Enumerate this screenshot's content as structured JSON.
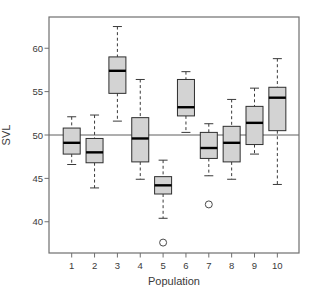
{
  "chart_data": {
    "type": "boxplot",
    "title": "",
    "xlabel": "Population",
    "ylabel": "SVL",
    "categories": [
      "1",
      "2",
      "3",
      "4",
      "5",
      "6",
      "7",
      "8",
      "9",
      "10"
    ],
    "yticks": [
      40,
      45,
      50,
      55,
      60
    ],
    "ylim": [
      36.4,
      63.6
    ],
    "reference_line": 50,
    "legend": "none",
    "grid": false,
    "boxes": [
      {
        "pop": "1",
        "whisker_low": 46.6,
        "q1": 47.8,
        "median": 49.1,
        "q3": 50.8,
        "whisker_high": 52.1,
        "outliers": []
      },
      {
        "pop": "2",
        "whisker_low": 43.9,
        "q1": 46.8,
        "median": 48.0,
        "q3": 49.6,
        "whisker_high": 52.3,
        "outliers": []
      },
      {
        "pop": "3",
        "whisker_low": 51.6,
        "q1": 54.8,
        "median": 57.4,
        "q3": 59.0,
        "whisker_high": 62.5,
        "outliers": []
      },
      {
        "pop": "4",
        "whisker_low": 44.9,
        "q1": 46.9,
        "median": 49.6,
        "q3": 52.0,
        "whisker_high": 56.4,
        "outliers": []
      },
      {
        "pop": "5",
        "whisker_low": 40.4,
        "q1": 43.2,
        "median": 44.2,
        "q3": 45.2,
        "whisker_high": 47.1,
        "outliers": [
          37.6
        ]
      },
      {
        "pop": "6",
        "whisker_low": 50.3,
        "q1": 52.2,
        "median": 53.2,
        "q3": 56.4,
        "whisker_high": 57.3,
        "outliers": []
      },
      {
        "pop": "7",
        "whisker_low": 45.3,
        "q1": 47.3,
        "median": 48.5,
        "q3": 50.3,
        "whisker_high": 51.3,
        "outliers": [
          42.0
        ]
      },
      {
        "pop": "8",
        "whisker_low": 44.9,
        "q1": 46.9,
        "median": 49.1,
        "q3": 51.0,
        "whisker_high": 54.1,
        "outliers": []
      },
      {
        "pop": "9",
        "whisker_low": 47.8,
        "q1": 48.9,
        "median": 51.4,
        "q3": 53.3,
        "whisker_high": 55.4,
        "outliers": []
      },
      {
        "pop": "10",
        "whisker_low": 44.3,
        "q1": 50.5,
        "median": 54.3,
        "q3": 55.5,
        "whisker_high": 58.8,
        "outliers": []
      }
    ],
    "colors": {
      "background": "#ffffff",
      "box_fill": "#d3d3d3",
      "box_border": "#2e2e2e",
      "median": "#000000",
      "whisker": "#3a3a3a",
      "outlier": "#4a4a4a",
      "reference_line": "#5f5f5f",
      "frame": "#6f6f6f",
      "text": "#3a3a3a"
    }
  }
}
